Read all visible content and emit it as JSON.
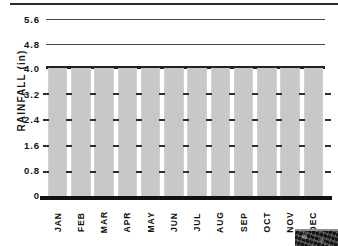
{
  "chart_data": {
    "type": "bar",
    "title": "",
    "subtitle": "",
    "xlabel": "",
    "ylabel": "RAINFALL (in)",
    "categories": [
      "JAN",
      "FEB",
      "MAR",
      "APR",
      "MAY",
      "JUN",
      "JUL",
      "AUG",
      "SEP",
      "OCT",
      "NOV",
      "DEC"
    ],
    "values": [
      4.0,
      4.0,
      4.0,
      4.0,
      4.0,
      4.0,
      4.0,
      4.0,
      4.0,
      4.0,
      4.0,
      4.0
    ],
    "ylim": [
      0,
      4.0
    ],
    "y_ticks": [
      "0",
      "0.8",
      "1.6",
      "2.4",
      "3.2",
      "4.0"
    ],
    "y_ticks_above_plot": [
      "4.8",
      "5.6"
    ],
    "grid": true,
    "legend": false,
    "legend_position": "none",
    "bar_color": "#c8c8c8",
    "axis_color": "#111111",
    "annotations": []
  },
  "axis": {
    "y_title": "RAINFALL (in)",
    "y_labels": {
      "t56": "5.6",
      "t48": "4.8",
      "t40": "4.0",
      "t32": "3.2",
      "t24": "2.4",
      "t16": "1.6",
      "t08": "0.8",
      "t00": "0"
    }
  },
  "months": {
    "jan": "JAN",
    "feb": "FEB",
    "mar": "MAR",
    "apr": "APR",
    "may": "MAY",
    "jun": "JUN",
    "jul": "JUL",
    "aug": "AUG",
    "sep": "SEP",
    "oct": "OCT",
    "nov": "NOV",
    "dec": "DEC"
  }
}
